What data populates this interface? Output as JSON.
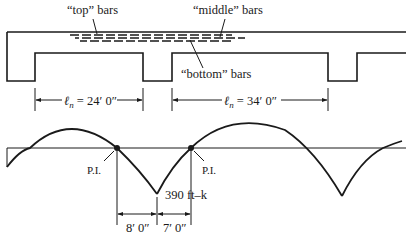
{
  "figure": {
    "labels": {
      "top_bars": "“top” bars",
      "middle_bars": "“middle” bars",
      "bottom_bars": "“bottom” bars"
    },
    "spans": [
      {
        "symbol": "ℓ",
        "subscript": "n",
        "value": " = 24′ 0″"
      },
      {
        "symbol": "ℓ",
        "subscript": "n",
        "value": " = 34′ 0″"
      }
    ],
    "moment_diagram": {
      "inflection_label_left": "P.I.",
      "inflection_label_right": "P.I.",
      "peak_moment": "390 ft–k",
      "dim_left": "8′ 0″",
      "dim_right": "7′ 0″"
    },
    "colors": {
      "line": "#1a1a1a",
      "background": "#ffffff"
    }
  }
}
